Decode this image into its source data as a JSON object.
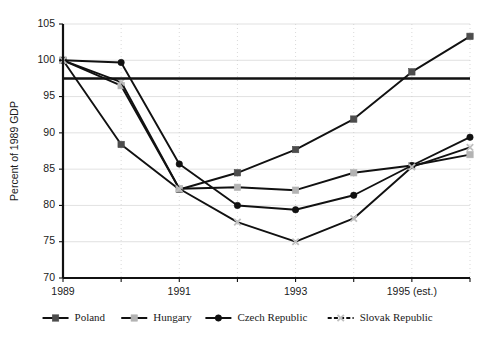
{
  "chart_data": {
    "type": "line",
    "title": "",
    "subtitle": "",
    "xlabel": "",
    "ylabel": "Percent of 1989 GDP",
    "ylim": [
      70,
      105
    ],
    "ytick_values": [
      70,
      75,
      80,
      85,
      90,
      95,
      100,
      105
    ],
    "ytick_labels": [
      "70",
      "75",
      "80",
      "85",
      "90",
      "95",
      "100",
      "105"
    ],
    "x": [
      1989,
      1990,
      1991,
      1992,
      1993,
      1994,
      1995,
      1996
    ],
    "xtick_labels": [
      "1989",
      "",
      "1991",
      "",
      "1993",
      "",
      "1995 (est.)",
      ""
    ],
    "xtick_labels_shown": [
      "1989",
      "1991",
      "1993",
      "1995 (est.)"
    ],
    "grid": "horizontal-light-and-vertical-dotted",
    "legend_position": "bottom",
    "reference_line": {
      "value": 97.5,
      "orientation": "horizontal",
      "style": "solid",
      "color": "#111111"
    },
    "series": [
      {
        "name": "Poland",
        "marker": "square",
        "marker_color": "#4d4d4d",
        "line_color": "#111111",
        "line_style": "solid",
        "values": [
          100.0,
          88.4,
          82.2,
          84.5,
          87.7,
          91.9,
          98.4,
          103.3
        ]
      },
      {
        "name": "Hungary",
        "marker": "square",
        "marker_color": "#b3b3b3",
        "line_color": "#111111",
        "line_style": "solid",
        "values": [
          100.0,
          96.5,
          82.3,
          82.5,
          82.1,
          84.5,
          85.5,
          87.0
        ]
      },
      {
        "name": "Czech Republic",
        "marker": "circle",
        "marker_color": "#111111",
        "line_color": "#111111",
        "line_style": "solid",
        "values": [
          100.0,
          99.7,
          85.7,
          80.0,
          79.4,
          81.4,
          85.5,
          89.4
        ]
      },
      {
        "name": "Slovak Republic",
        "marker": "x",
        "marker_color": "#bfbfbf",
        "line_color": "#111111",
        "line_style": "dashed",
        "values": [
          100.0,
          97.0,
          82.3,
          77.7,
          75.0,
          78.2,
          85.3,
          88.0
        ]
      }
    ]
  },
  "legend": {
    "items": [
      {
        "label": "Poland"
      },
      {
        "label": "Hungary"
      },
      {
        "label": "Czech Republic"
      },
      {
        "label": "Slovak Republic"
      }
    ]
  },
  "axis": {
    "y_title": "Percent of 1989 GDP"
  }
}
